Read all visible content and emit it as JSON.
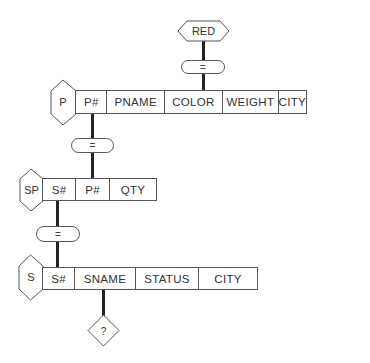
{
  "diagram": {
    "type": "query-by-example join diagram",
    "result_node": {
      "label": "RED",
      "shape": "hexagon"
    },
    "connectors": [
      {
        "id": "eq1",
        "label": "="
      },
      {
        "id": "eq2",
        "label": "="
      },
      {
        "id": "eq3",
        "label": "="
      }
    ],
    "tables": [
      {
        "name": "P",
        "columns": [
          "P#",
          "PNAME",
          "COLOR",
          "WEIGHT",
          "CITY"
        ]
      },
      {
        "name": "SP",
        "columns": [
          "S#",
          "P#",
          "QTY"
        ]
      },
      {
        "name": "S",
        "columns": [
          "S#",
          "SNAME",
          "STATUS",
          "CITY"
        ]
      }
    ],
    "output_node": {
      "label": "?",
      "shape": "diamond"
    }
  }
}
